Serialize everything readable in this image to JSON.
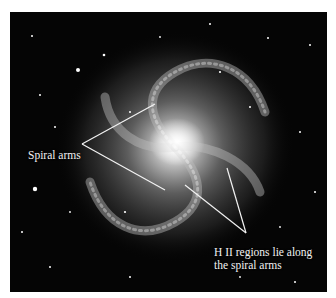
{
  "figure": {
    "background_color": "#050505",
    "annotation_color": "#f2f2f2",
    "labels": {
      "spiral_arms": "Spiral arms",
      "hii_line1": "H II regions lie along",
      "hii_line2": "the spiral arms"
    }
  }
}
